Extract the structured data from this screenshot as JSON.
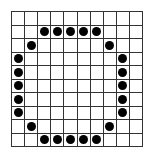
{
  "grid": {
    "rows": 10,
    "cols": 10,
    "line_color": "#333333",
    "dot_color": "#000000",
    "dots": [
      [
        1,
        2
      ],
      [
        1,
        3
      ],
      [
        1,
        4
      ],
      [
        1,
        5
      ],
      [
        1,
        6
      ],
      [
        2,
        1
      ],
      [
        2,
        7
      ],
      [
        3,
        0
      ],
      [
        3,
        8
      ],
      [
        4,
        0
      ],
      [
        4,
        8
      ],
      [
        5,
        0
      ],
      [
        5,
        8
      ],
      [
        6,
        0
      ],
      [
        6,
        8
      ],
      [
        7,
        0
      ],
      [
        7,
        8
      ],
      [
        8,
        1
      ],
      [
        8,
        7
      ],
      [
        9,
        2
      ],
      [
        9,
        3
      ],
      [
        9,
        4
      ],
      [
        9,
        5
      ],
      [
        9,
        6
      ]
    ]
  }
}
